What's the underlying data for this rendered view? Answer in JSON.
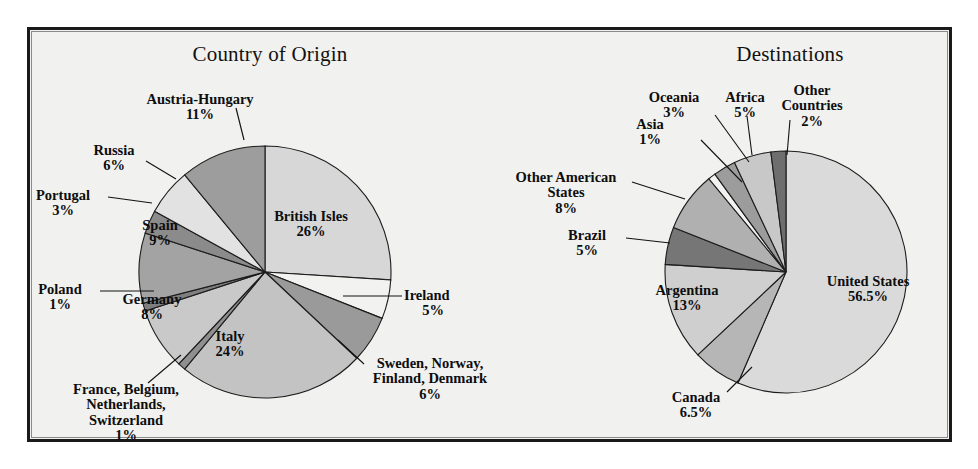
{
  "figure": {
    "background": "#f1f1ef",
    "frame_color": "#1a1a1a"
  },
  "charts": [
    {
      "id": "origin",
      "title": "Country of Origin"
    },
    {
      "id": "destinations",
      "title": "Destinations"
    }
  ],
  "chart_data": [
    {
      "type": "pie",
      "title": "Country of Origin",
      "xlabel": "",
      "ylabel": "",
      "legend": "none",
      "start_angle_deg": 0,
      "direction": "clockwise",
      "categories": [
        "British Isles",
        "Ireland",
        "Sweden, Norway, Finland, Denmark",
        "Italy",
        "France, Belgium, Netherlands, Switzerland",
        "Germany",
        "Poland",
        "Spain",
        "Portugal",
        "Russia",
        "Austria-Hungary"
      ],
      "values": [
        26,
        5,
        6,
        24,
        1,
        8,
        1,
        9,
        3,
        6,
        11
      ],
      "value_labels": [
        "26%",
        "5%",
        "6%",
        "24%",
        "1%",
        "8%",
        "1%",
        "9%",
        "3%",
        "6%",
        "11%"
      ],
      "colors": [
        "#d7d7d7",
        "#f2f2f0",
        "#9a9a9a",
        "#c3c3c3",
        "#8f8f8f",
        "#c9c9c9",
        "#7f7f7f",
        "#a3a3a3",
        "#8b8b8b",
        "#e2e2e2",
        "#9d9d9d"
      ]
    },
    {
      "type": "pie",
      "title": "Destinations",
      "xlabel": "",
      "ylabel": "",
      "legend": "none",
      "start_angle_deg": 0,
      "direction": "clockwise",
      "categories": [
        "United States",
        "Canada",
        "Argentina",
        "Brazil",
        "Other American States",
        "Asia",
        "Oceania",
        "Africa",
        "Other Countries"
      ],
      "values": [
        56.5,
        6.5,
        13,
        5,
        8,
        1,
        3,
        5,
        2
      ],
      "value_labels": [
        "56.5%",
        "6.5%",
        "13%",
        "5%",
        "8%",
        "1%",
        "3%",
        "5%",
        "2%"
      ],
      "colors": [
        "#dadada",
        "#b6b6b6",
        "#cfcfcf",
        "#767676",
        "#b0b0b0",
        "#f2f2f0",
        "#9c9c9c",
        "#c8c8c8",
        "#6e6e6e"
      ]
    }
  ],
  "labels": {
    "origin": [
      {
        "name": "british-isles",
        "text": "British Isles",
        "pct": "26%"
      },
      {
        "name": "ireland",
        "text": "Ireland",
        "pct": "5%"
      },
      {
        "name": "nordics",
        "line1": "Sweden, Norway,",
        "line2": "Finland, Denmark",
        "pct": "6%"
      },
      {
        "name": "italy",
        "text": "Italy",
        "pct": "24%"
      },
      {
        "name": "france-benelux",
        "line1": "France, Belgium,",
        "line2": "Netherlands,",
        "line3": "Switzerland",
        "pct": "1%"
      },
      {
        "name": "germany",
        "text": "Germany",
        "pct": "8%"
      },
      {
        "name": "poland",
        "text": "Poland",
        "pct": "1%"
      },
      {
        "name": "spain",
        "text": "Spain",
        "pct": "9%"
      },
      {
        "name": "portugal",
        "text": "Portugal",
        "pct": "3%"
      },
      {
        "name": "russia",
        "text": "Russia",
        "pct": "6%"
      },
      {
        "name": "austria-hungary",
        "text": "Austria-Hungary",
        "pct": "11%"
      }
    ],
    "destinations": [
      {
        "name": "united-states",
        "text": "United States",
        "pct": "56.5%"
      },
      {
        "name": "canada",
        "text": "Canada",
        "pct": "6.5%"
      },
      {
        "name": "argentina",
        "text": "Argentina",
        "pct": "13%"
      },
      {
        "name": "brazil",
        "text": "Brazil",
        "pct": "5%"
      },
      {
        "name": "other-american-states",
        "line1": "Other American",
        "line2": "States",
        "pct": "8%"
      },
      {
        "name": "asia",
        "text": "Asia",
        "pct": "1%"
      },
      {
        "name": "oceania",
        "text": "Oceania",
        "pct": "3%"
      },
      {
        "name": "africa",
        "text": "Africa",
        "pct": "5%"
      },
      {
        "name": "other-countries",
        "line1": "Other",
        "line2": "Countries",
        "pct": "2%"
      }
    ]
  }
}
